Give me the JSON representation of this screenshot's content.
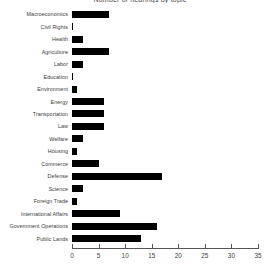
{
  "chart_data": {
    "type": "bar",
    "orientation": "horizontal",
    "title": "Number of hearings by topic",
    "xlabel": "",
    "ylabel": "",
    "xlim": [
      0,
      35
    ],
    "xticks": [
      0,
      5,
      10,
      15,
      20,
      25,
      30,
      35
    ],
    "grid": false,
    "legend": null,
    "bar_color": "#000000",
    "categories": [
      "Macroeconomics",
      "Civil Rights",
      "Health",
      "Agriculture",
      "Labor",
      "Education",
      "Environment",
      "Energy",
      "Transportation",
      "Law",
      "Welfare",
      "Housing",
      "Commerce",
      "Defense",
      "Science",
      "Foreign Trade",
      "International Affairs",
      "Government Operations",
      "Public Lands"
    ],
    "values": [
      7,
      0,
      2,
      7,
      2,
      0,
      1,
      6,
      6,
      6,
      2,
      1,
      5,
      17,
      2,
      1,
      9,
      16,
      13
    ]
  }
}
